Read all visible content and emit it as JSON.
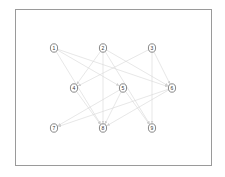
{
  "diagram": {
    "type": "directed-graph",
    "colors": {
      "frame_border": "#9a9a9a",
      "edge": "#d6d6d6",
      "node_stroke": "#555555",
      "label": "#333333"
    },
    "nodes": [
      {
        "id": "1",
        "label": "1",
        "x": 54,
        "y": 48
      },
      {
        "id": "2",
        "label": "2",
        "x": 103,
        "y": 48
      },
      {
        "id": "3",
        "label": "3",
        "x": 152,
        "y": 48
      },
      {
        "id": "4",
        "label": "4",
        "x": 74,
        "y": 88
      },
      {
        "id": "5",
        "label": "5",
        "x": 123,
        "y": 88
      },
      {
        "id": "6",
        "label": "6",
        "x": 172,
        "y": 88
      },
      {
        "id": "7",
        "label": "7",
        "x": 54,
        "y": 128
      },
      {
        "id": "8",
        "label": "8",
        "x": 103,
        "y": 128
      },
      {
        "id": "9",
        "label": "9",
        "x": 152,
        "y": 128
      }
    ],
    "edges": [
      {
        "from": "1",
        "to": "5"
      },
      {
        "from": "1",
        "to": "6"
      },
      {
        "from": "1",
        "to": "8"
      },
      {
        "from": "2",
        "to": "4"
      },
      {
        "from": "2",
        "to": "6"
      },
      {
        "from": "2",
        "to": "8"
      },
      {
        "from": "2",
        "to": "9"
      },
      {
        "from": "3",
        "to": "4"
      },
      {
        "from": "3",
        "to": "6"
      },
      {
        "from": "3",
        "to": "9"
      },
      {
        "from": "4",
        "to": "8"
      },
      {
        "from": "5",
        "to": "7"
      },
      {
        "from": "5",
        "to": "8"
      },
      {
        "from": "5",
        "to": "9"
      },
      {
        "from": "6",
        "to": "7"
      },
      {
        "from": "6",
        "to": "8"
      }
    ]
  }
}
